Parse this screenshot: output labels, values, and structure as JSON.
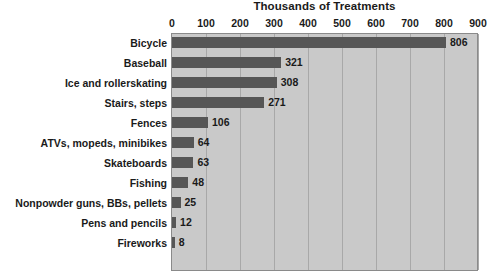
{
  "chart_data": {
    "type": "bar",
    "orientation": "horizontal",
    "title": "Thousands of Treatments",
    "xlabel": "",
    "ylabel": "",
    "xlim": [
      0,
      900
    ],
    "xticks": [
      0,
      100,
      200,
      300,
      400,
      500,
      600,
      700,
      800,
      900
    ],
    "grid": true,
    "legend": false,
    "categories": [
      "Bicycle",
      "Baseball",
      "Ice and rollerskating",
      "Stairs, steps",
      "Fences",
      "ATVs, mopeds, minibikes",
      "Skateboards",
      "Fishing",
      "Nonpowder guns, BBs, pellets",
      "Pens and pencils",
      "Fireworks"
    ],
    "values": [
      806,
      321,
      308,
      271,
      106,
      64,
      63,
      48,
      25,
      12,
      8
    ],
    "value_labels": [
      "806",
      "321",
      "308",
      "271",
      "106",
      "64",
      "63",
      "48",
      "25",
      "12",
      "8"
    ],
    "tick_labels": [
      "0",
      "100",
      "200",
      "300",
      "400",
      "500",
      "600",
      "700",
      "800",
      "900"
    ]
  },
  "colors": {
    "bar": "#565656",
    "plot_background": "#c9c9c9",
    "gridline": "#a8a8a8",
    "plot_border": "#8a8a8a",
    "page_background": "#ffffff",
    "text": "#1a1a1a"
  }
}
